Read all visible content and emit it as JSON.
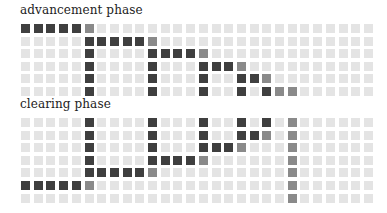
{
  "panels": [
    {
      "id": "advancement",
      "label": "advancement phase",
      "label_top": 5,
      "grid_top": 24,
      "rows": 6,
      "cols": 28,
      "dark": [
        [
          0,
          0
        ],
        [
          0,
          1
        ],
        [
          0,
          2
        ],
        [
          0,
          3
        ],
        [
          0,
          4
        ],
        [
          1,
          5
        ],
        [
          1,
          6
        ],
        [
          1,
          7
        ],
        [
          1,
          8
        ],
        [
          1,
          9
        ],
        [
          2,
          5
        ],
        [
          2,
          10
        ],
        [
          2,
          11
        ],
        [
          2,
          12
        ],
        [
          2,
          13
        ],
        [
          3,
          5
        ],
        [
          3,
          10
        ],
        [
          3,
          14
        ],
        [
          3,
          15
        ],
        [
          3,
          16
        ],
        [
          4,
          5
        ],
        [
          4,
          10
        ],
        [
          4,
          14
        ],
        [
          4,
          17
        ],
        [
          4,
          18
        ],
        [
          5,
          5
        ],
        [
          5,
          10
        ],
        [
          5,
          14
        ],
        [
          5,
          17
        ],
        [
          5,
          19
        ]
      ],
      "medium": [
        [
          0,
          5
        ],
        [
          1,
          10
        ],
        [
          2,
          14
        ],
        [
          3,
          17
        ],
        [
          4,
          19
        ],
        [
          5,
          20
        ],
        [
          5,
          21
        ]
      ]
    },
    {
      "id": "clearing",
      "label": "clearing phase",
      "label_top": 99,
      "grid_top": 118,
      "rows": 7,
      "cols": 28,
      "dark": [
        [
          0,
          5
        ],
        [
          0,
          10
        ],
        [
          0,
          14
        ],
        [
          0,
          17
        ],
        [
          0,
          19
        ],
        [
          1,
          5
        ],
        [
          1,
          10
        ],
        [
          1,
          14
        ],
        [
          1,
          17
        ],
        [
          1,
          18
        ],
        [
          2,
          5
        ],
        [
          2,
          10
        ],
        [
          2,
          14
        ],
        [
          2,
          15
        ],
        [
          2,
          16
        ],
        [
          3,
          5
        ],
        [
          3,
          10
        ],
        [
          3,
          11
        ],
        [
          3,
          12
        ],
        [
          3,
          13
        ],
        [
          4,
          5
        ],
        [
          4,
          6
        ],
        [
          4,
          7
        ],
        [
          4,
          8
        ],
        [
          4,
          9
        ],
        [
          5,
          0
        ],
        [
          5,
          1
        ],
        [
          5,
          2
        ],
        [
          5,
          3
        ],
        [
          5,
          4
        ]
      ],
      "medium": [
        [
          0,
          21
        ],
        [
          1,
          19
        ],
        [
          1,
          21
        ],
        [
          2,
          17
        ],
        [
          2,
          21
        ],
        [
          3,
          14
        ],
        [
          3,
          21
        ],
        [
          4,
          10
        ],
        [
          4,
          21
        ],
        [
          5,
          5
        ],
        [
          5,
          21
        ],
        [
          6,
          21
        ]
      ]
    }
  ],
  "colors": {
    "empty": "#e4e4e4",
    "dark": "#3f3f3f",
    "medium": "#8a8a8a"
  },
  "cell_pitch_x": 12.7,
  "cell_pitch_y": 12.6,
  "cell_size": 9
}
